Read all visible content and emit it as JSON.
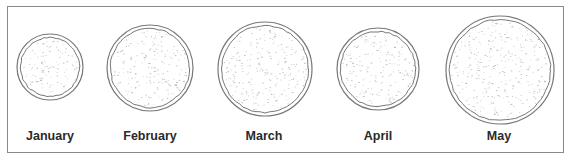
{
  "figure": {
    "items": [
      {
        "label": "January",
        "cx": 50,
        "cy": 67,
        "r": 33
      },
      {
        "label": "February",
        "cx": 150,
        "cy": 68,
        "r": 43
      },
      {
        "label": "March",
        "cx": 265,
        "cy": 69,
        "r": 47
      },
      {
        "label": "April",
        "cx": 378,
        "cy": 69,
        "r": 41
      },
      {
        "label": "May",
        "cx": 500,
        "cy": 70,
        "r": 54
      }
    ],
    "colors": {
      "outline": "#777777",
      "speckle": "#9a9a9a",
      "frame": "#8a8a8a",
      "text": "#2a2a2a"
    }
  }
}
